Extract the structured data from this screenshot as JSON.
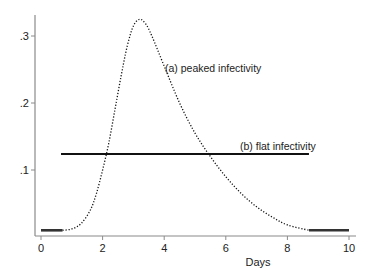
{
  "chart_data": {
    "type": "line",
    "title": "",
    "xlabel": "Days",
    "ylabel": "",
    "xlim": [
      0,
      10
    ],
    "ylim": [
      0,
      0.33
    ],
    "grid": false,
    "x_ticks": [
      0,
      2,
      4,
      6,
      8,
      10
    ],
    "x_tick_labels": [
      "0",
      "2",
      "4",
      "6",
      "8",
      "10"
    ],
    "y_ticks": [
      0.1,
      0.2,
      0.3
    ],
    "y_tick_labels": [
      ".1",
      ".2",
      ".3"
    ],
    "series": [
      {
        "name": "(a) peaked infectivity",
        "style": "dotted",
        "x": [
          0.7,
          1.0,
          1.3,
          1.6,
          1.8,
          2.0,
          2.2,
          2.4,
          2.6,
          2.8,
          3.0,
          3.2,
          3.4,
          3.6,
          4.0,
          4.5,
          5.0,
          5.5,
          6.0,
          6.5,
          7.0,
          7.5,
          8.0,
          8.7
        ],
        "y": [
          0.01,
          0.012,
          0.02,
          0.04,
          0.065,
          0.1,
          0.14,
          0.19,
          0.24,
          0.285,
          0.315,
          0.325,
          0.318,
          0.3,
          0.255,
          0.2,
          0.155,
          0.12,
          0.09,
          0.065,
          0.045,
          0.03,
          0.018,
          0.01
        ]
      },
      {
        "name": "(b) flat infectivity",
        "style": "solid",
        "x": [
          0.65,
          8.7
        ],
        "y": [
          0.124,
          0.124
        ]
      },
      {
        "name": "baseline",
        "style": "solid-thick",
        "segments": [
          {
            "x": [
              0,
              0.7
            ],
            "y": [
              0.01,
              0.01
            ]
          },
          {
            "x": [
              8.7,
              10
            ],
            "y": [
              0.01,
              0.01
            ]
          }
        ]
      }
    ],
    "annotations": [
      {
        "text": "(a) peaked infectivity",
        "x": 4.0,
        "y": 0.25
      },
      {
        "text": "(b) flat infectivity",
        "x": 6.45,
        "y": 0.135
      }
    ],
    "legend": "none (inline annotations)"
  },
  "labels": {
    "xlabel": "Days",
    "annot_a": "(a) peaked infectivity",
    "annot_b": "(b) flat infectivity",
    "xticks": [
      "0",
      "2",
      "4",
      "6",
      "8",
      "10"
    ],
    "yticks": [
      ".1",
      ".2",
      ".3"
    ]
  },
  "colors": {
    "axis": "#8a8a8a",
    "line": "#111111",
    "text": "#222222"
  }
}
